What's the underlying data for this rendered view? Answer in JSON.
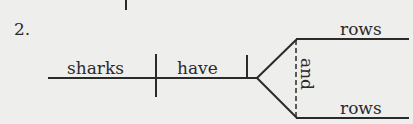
{
  "diagram": {
    "type": "sentence-diagram",
    "item_number": "2.",
    "subject": "sharks",
    "verb": "have",
    "compound_object": {
      "conjunction": "and",
      "items": [
        "rows",
        "rows"
      ]
    },
    "colors": {
      "background": "#eeeeec",
      "ink": "#2a2a2a"
    }
  }
}
